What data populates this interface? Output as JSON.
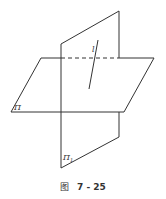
{
  "diagram": {
    "labels": {
      "line": "l",
      "plane_horizontal": "Π",
      "plane_vertical": "Π",
      "plane_vertical_sub": "1"
    },
    "caption": {
      "prefix": "图",
      "number": "7 - 25"
    },
    "colors": {
      "stroke": "#333333",
      "background": "#ffffff"
    }
  }
}
